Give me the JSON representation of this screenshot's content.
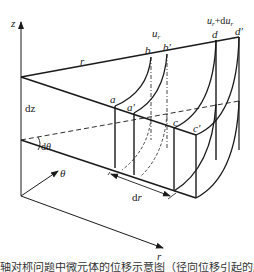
{
  "diagram": {
    "type": "3d-element-displacement",
    "axes": {
      "z": "z",
      "theta": "θ",
      "r": "r"
    },
    "labels": {
      "r_edge": "r",
      "dz": "dz",
      "dtheta": "dθ",
      "dr": "dr",
      "u_r": "u",
      "u_r_sub": "r",
      "u_r_plus_du": "u",
      "u_r_plus_du_sub1": "r",
      "u_r_plus_du_mid": "+du",
      "u_r_plus_du_sub2": "r"
    },
    "points": {
      "a": "a",
      "a_prime": "a′",
      "b": "b",
      "b_prime": "b′",
      "c": "c",
      "c_prime": "c′",
      "d": "d",
      "d_prime": "d′"
    },
    "line_color": "#1a1a1a"
  },
  "caption": {
    "text": "轴对称问题中微元体的位移示意图（径向位移引起的应变）"
  }
}
